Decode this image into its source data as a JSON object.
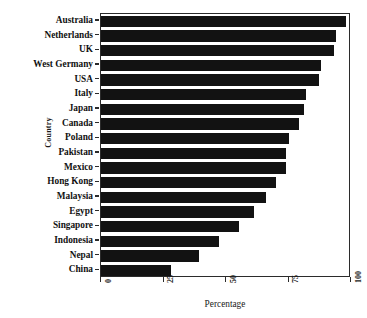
{
  "chart_data": {
    "type": "bar",
    "orientation": "horizontal",
    "title": "",
    "xlabel": "Percentage",
    "ylabel": "Country",
    "xlim": [
      0,
      100
    ],
    "xticks": [
      0,
      25,
      50,
      75,
      100
    ],
    "xtick_labels": [
      "0",
      "25",
      "50",
      "75",
      "100"
    ],
    "grid": false,
    "legend": null,
    "bar_color": "#121212",
    "axis_color": "#2b2b2b",
    "background": "#ffffff",
    "categories": [
      "Australia",
      "Netherlands",
      "UK",
      "West Germany",
      "USA",
      "Italy",
      "Japan",
      "Canada",
      "Poland",
      "Pakistan",
      "Mexico",
      "Hong Kong",
      "Malaysia",
      "Egypt",
      "Singapore",
      "Indonesia",
      "Nepal",
      "China"
    ],
    "values": [
      98,
      94,
      93,
      88,
      87,
      82,
      81,
      79,
      75,
      74,
      74,
      70,
      66,
      61,
      55,
      47,
      39,
      28
    ]
  }
}
